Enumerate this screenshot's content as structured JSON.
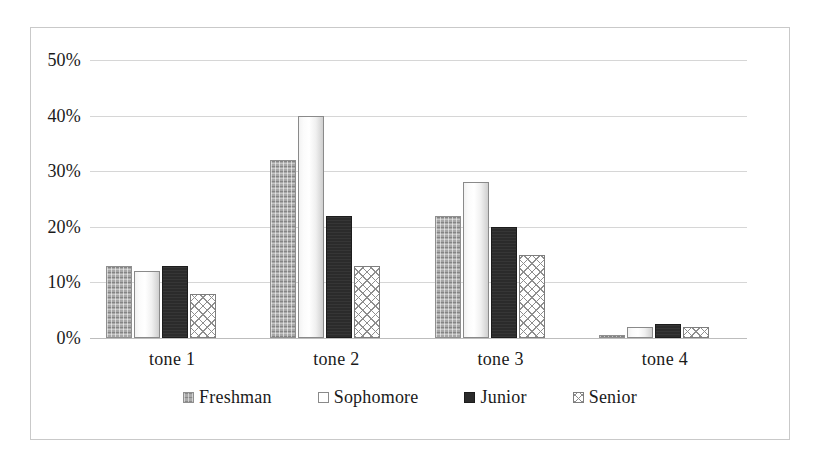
{
  "chart_data": {
    "type": "bar",
    "title": "",
    "subtitle": "",
    "xlabel": "",
    "ylabel": "",
    "categories": [
      "tone 1",
      "tone 2",
      "tone 3",
      "tone 4"
    ],
    "series": [
      {
        "name": "Freshman",
        "values": [
          13,
          32,
          22,
          0.5
        ]
      },
      {
        "name": "Sophomore",
        "values": [
          12,
          40,
          28,
          2
        ]
      },
      {
        "name": "Junior",
        "values": [
          13,
          22,
          20,
          2.5
        ]
      },
      {
        "name": "Senior",
        "values": [
          8,
          13,
          15,
          2
        ]
      }
    ],
    "ylim": [
      0,
      50
    ],
    "yticks": [
      0,
      10,
      20,
      30,
      40,
      50
    ],
    "ytick_labels": [
      "0%",
      "10%",
      "20%",
      "30%",
      "40%",
      "50%"
    ],
    "grid": true,
    "legend_position": "bottom",
    "legend_entries": [
      "Freshman",
      "Sophomore",
      "Junior",
      "Senior"
    ],
    "colors": {
      "freshman": "#a7a7a7",
      "sophomore": "#ffffff",
      "junior": "#2b2b2b",
      "senior": "#ffffff",
      "gridline": "#d6d6d6",
      "border": "#c9c9c9",
      "text": "#1a1a1a"
    },
    "series_patterns": {
      "freshman": "fine-checker-grey",
      "sophomore": "solid-white-outlined",
      "junior": "solid-dark",
      "senior": "diagonal-crosshatch"
    }
  }
}
